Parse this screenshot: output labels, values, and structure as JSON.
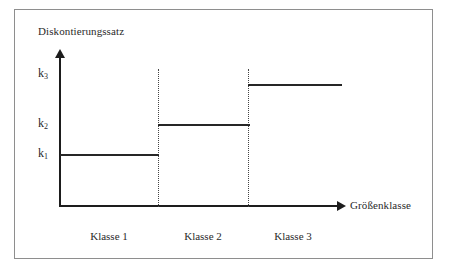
{
  "figure": {
    "background_color": "#ffffff",
    "frame_color": "#8e8e8e",
    "line_color": "#262626"
  },
  "axes": {
    "y_label": "Diskontierungssatz",
    "x_label": "Größenklasse",
    "y_arrow": "arrow-up",
    "x_arrow": "arrow-right"
  },
  "ticks": {
    "k3": {
      "base": "k",
      "sub": "3"
    },
    "k2": {
      "base": "k",
      "sub": "2"
    },
    "k1": {
      "base": "k",
      "sub": "1"
    }
  },
  "classes": [
    {
      "label": "Klasse 1"
    },
    {
      "label": "Klasse 2"
    },
    {
      "label": "Klasse 3"
    }
  ],
  "chart_data": {
    "type": "bar",
    "title": "",
    "subtitle": "",
    "xlabel": "Größenklasse",
    "ylabel": "Diskontierungssatz",
    "categories": [
      "Klasse 1",
      "Klasse 2",
      "Klasse 3"
    ],
    "tick_labels": [
      "k₁",
      "k₂",
      "k₃"
    ],
    "values": [
      "k1",
      "k2",
      "k3"
    ],
    "series": [
      {
        "name": "Diskontierungssatz",
        "values": [
          "k1",
          "k2",
          "k3"
        ],
        "style": "step"
      }
    ],
    "annotations": [
      "Step function: discount rate increases with size class",
      "k1 < k2 < k3",
      "Dotted vertical lines mark class boundaries"
    ],
    "axis_ranges": {
      "y": [
        "0",
        "k3"
      ],
      "x": [
        "Klasse 1",
        "Klasse 3"
      ]
    },
    "grid": false,
    "legend": "none",
    "tick_values_ordered_bottom_to_top": [
      "k₁",
      "k₂",
      "k₃"
    ]
  }
}
